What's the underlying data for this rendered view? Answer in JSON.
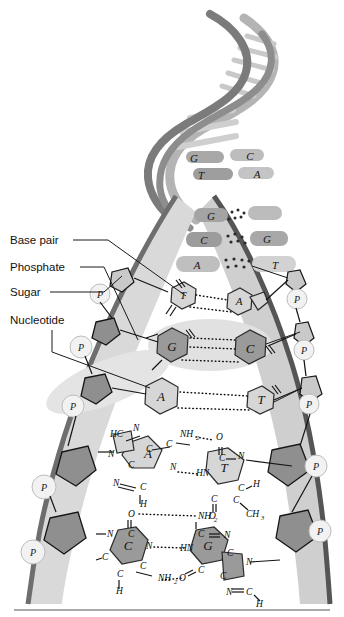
{
  "figure": {
    "background": "#ffffff"
  },
  "labels": [
    {
      "id": "base-pair",
      "text": "Base pair",
      "x": 10,
      "y": 244
    },
    {
      "id": "phosphate",
      "text": "Phosphate",
      "x": 10,
      "y": 271
    },
    {
      "id": "sugar",
      "text": "Sugar",
      "x": 10,
      "y": 296
    },
    {
      "id": "nucleotide",
      "text": "Nucleotide",
      "x": 10,
      "y": 324
    }
  ],
  "helix_rungs": [
    {
      "left": "G",
      "right": "C",
      "y": 158
    },
    {
      "left": "T",
      "right": "A",
      "y": 174
    }
  ],
  "ladder_pairs": [
    {
      "left": "G",
      "right": "",
      "y": 216,
      "lx": 212,
      "rx": 258,
      "style": "dotted"
    },
    {
      "left": "C",
      "right": "G",
      "y": 240,
      "lx": 205,
      "rx": 266,
      "style": "dotted"
    },
    {
      "left": "A",
      "right": "T",
      "y": 265,
      "lx": 196,
      "rx": 274,
      "style": "dotted"
    },
    {
      "left": "T",
      "right": "A",
      "y": 295,
      "lx": 182,
      "rx": 240,
      "style": "dotted"
    },
    {
      "left": "G",
      "right": "C",
      "y": 345,
      "lx": 170,
      "rx": 252,
      "style": "dotted"
    },
    {
      "left": "A",
      "right": "T",
      "y": 398,
      "lx": 160,
      "rx": 262,
      "style": "dotted"
    }
  ],
  "phosphate_marks": {
    "letter": "P",
    "left": [
      {
        "x": 100,
        "y": 294
      },
      {
        "x": 81,
        "y": 347
      },
      {
        "x": 73,
        "y": 406
      },
      {
        "x": 44,
        "y": 487
      },
      {
        "x": 33,
        "y": 552
      }
    ],
    "right": [
      {
        "x": 297,
        "y": 299
      },
      {
        "x": 304,
        "y": 350
      },
      {
        "x": 309,
        "y": 404
      },
      {
        "x": 316,
        "y": 466
      },
      {
        "x": 320,
        "y": 531
      }
    ]
  },
  "chem_pairs": [
    {
      "id": "adenine-thymine",
      "left_base": "A",
      "right_base": "T",
      "left_atoms": [
        {
          "t": "HC",
          "x": 110,
          "y": 437
        },
        {
          "t": "N",
          "x": 133,
          "y": 431
        },
        {
          "t": "C",
          "x": 146,
          "y": 452
        },
        {
          "t": "C",
          "x": 166,
          "y": 447
        },
        {
          "t": "N",
          "x": 108,
          "y": 457
        },
        {
          "t": "C",
          "x": 128,
          "y": 468
        },
        {
          "t": "N",
          "x": 113,
          "y": 486
        },
        {
          "t": "C",
          "x": 140,
          "y": 490
        },
        {
          "t": "N",
          "x": 170,
          "y": 470
        },
        {
          "t": "H",
          "x": 140,
          "y": 507
        }
      ],
      "left_groups": [
        {
          "t": "NH",
          "sub": "2",
          "x": 182,
          "y": 437
        }
      ],
      "right_atoms": [
        {
          "t": "O",
          "x": 216,
          "y": 440
        },
        {
          "t": "C",
          "x": 219,
          "y": 458
        },
        {
          "t": "N",
          "x": 240,
          "y": 457
        },
        {
          "t": "HN",
          "x": 199,
          "y": 473
        },
        {
          "t": "C",
          "x": 240,
          "y": 489
        },
        {
          "t": "H",
          "x": 255,
          "y": 483
        },
        {
          "t": "C",
          "x": 215,
          "y": 497
        },
        {
          "t": "C",
          "x": 235,
          "y": 500
        },
        {
          "t": "O",
          "x": 211,
          "y": 516
        }
      ],
      "right_groups": [
        {
          "t": "CH",
          "sub": "3",
          "x": 248,
          "y": 514
        }
      ]
    },
    {
      "id": "cytosine-guanine",
      "left_base": "C",
      "right_base": "G",
      "left_atoms": [
        {
          "t": "O",
          "x": 130,
          "y": 514
        },
        {
          "t": "C",
          "x": 131,
          "y": 535
        },
        {
          "t": "N",
          "x": 110,
          "y": 534
        },
        {
          "t": "N",
          "x": 148,
          "y": 546
        },
        {
          "t": "C",
          "x": 105,
          "y": 557
        },
        {
          "t": "C",
          "x": 142,
          "y": 566
        },
        {
          "t": "C",
          "x": 120,
          "y": 574
        },
        {
          "t": "H",
          "x": 119,
          "y": 592
        }
      ],
      "left_groups": [
        {
          "t": "NH",
          "sub": "2",
          "x": 162,
          "y": 578
        }
      ],
      "right_atoms": [
        {
          "t": "NH",
          "sub": "2",
          "x": 203,
          "y": 516
        },
        {
          "t": "C",
          "x": 200,
          "y": 534
        },
        {
          "t": "N",
          "x": 226,
          "y": 535
        },
        {
          "t": "HN",
          "x": 183,
          "y": 548
        },
        {
          "t": "C",
          "x": 229,
          "y": 553
        },
        {
          "t": "N",
          "x": 248,
          "y": 562
        },
        {
          "t": "C",
          "x": 200,
          "y": 570
        },
        {
          "t": "O",
          "x": 182,
          "y": 578
        },
        {
          "t": "C",
          "x": 222,
          "y": 576
        },
        {
          "t": "N",
          "x": 228,
          "y": 592
        },
        {
          "t": "C",
          "x": 248,
          "y": 592
        },
        {
          "t": "H",
          "x": 258,
          "y": 604
        }
      ],
      "right_groups": []
    }
  ],
  "colors": {
    "ink": "#111111",
    "ribbon_dark": "#6f6f6f",
    "ribbon_mid": "#9a9a9a",
    "ribbon_light": "#c8c8c8",
    "base_dark": "#9a9a9a",
    "base_light": "#d6d6d6",
    "highlight": "#e2e2e2",
    "divider": "#8c8c8c"
  }
}
